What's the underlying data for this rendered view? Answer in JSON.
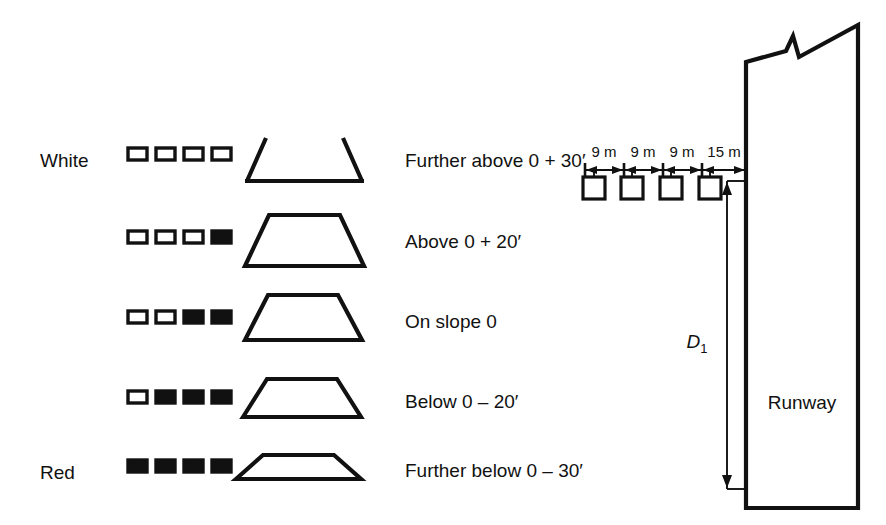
{
  "figure": {
    "ink_color": "#111111",
    "background_color": "#ffffff"
  },
  "legend": {
    "top_label": "White",
    "bottom_label": "Red"
  },
  "rows": [
    {
      "id": "further-above",
      "side_label": "White",
      "description": "Further above 0 + 30′",
      "lights": [
        "white",
        "white",
        "white",
        "white"
      ],
      "trapezoid_style": "open-top"
    },
    {
      "id": "above",
      "side_label": "",
      "description": "Above 0 + 20′",
      "lights": [
        "white",
        "white",
        "white",
        "red"
      ],
      "trapezoid_style": "tall"
    },
    {
      "id": "on-slope",
      "side_label": "",
      "description": "On slope 0",
      "lights": [
        "white",
        "white",
        "red",
        "red"
      ],
      "trapezoid_style": "medium"
    },
    {
      "id": "below",
      "side_label": "",
      "description": "Below 0 – 20′",
      "lights": [
        "white",
        "red",
        "red",
        "red"
      ],
      "trapezoid_style": "low"
    },
    {
      "id": "further-below",
      "side_label": "Red",
      "description": "Further below 0 – 30′",
      "lights": [
        "red",
        "red",
        "red",
        "red"
      ],
      "trapezoid_style": "flat"
    }
  ],
  "layout": {
    "spacings": [
      "9 m",
      "9 m",
      "9 m",
      "15 m"
    ],
    "unit_count": 4,
    "distance_label": "D",
    "distance_subscript": "1",
    "runway_label": "Runway",
    "break_symbol": "zigzag-break"
  }
}
